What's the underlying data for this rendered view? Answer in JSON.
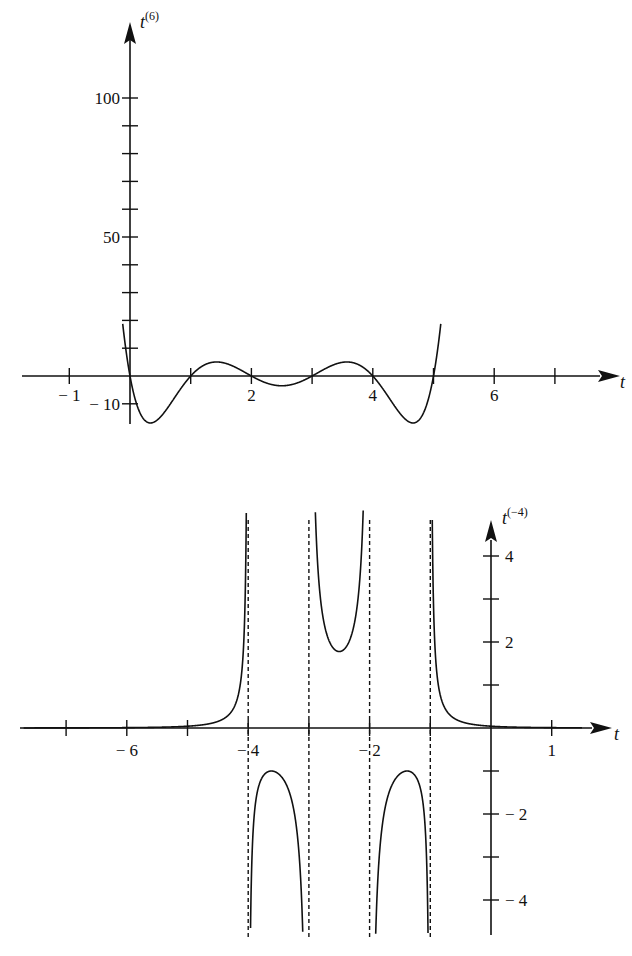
{
  "chart_data": [
    {
      "type": "line",
      "title": "",
      "function": "t^(6) = t(t-1)(t-2)(t-3)(t-4)(t-5)",
      "xlabel": "t",
      "ylabel": "t^(6)",
      "ylabel_base": "t",
      "ylabel_sup": "(6)",
      "xlim": [
        -1.7,
        7.3
      ],
      "ylim": [
        -12,
        106
      ],
      "x_ticks": [
        -1,
        0,
        1,
        2,
        3,
        4,
        5,
        6,
        7
      ],
      "x_tick_labels": [
        {
          "value": -1,
          "label": "− 1"
        },
        {
          "value": 2,
          "label": "2"
        },
        {
          "value": 4,
          "label": "4"
        },
        {
          "value": 6,
          "label": "6"
        }
      ],
      "y_ticks": [
        -10,
        10,
        20,
        30,
        40,
        50,
        60,
        70,
        80,
        90,
        100
      ],
      "y_tick_labels": [
        {
          "value": 100,
          "label": "100"
        },
        {
          "value": 50,
          "label": "50"
        },
        {
          "value": -10,
          "label": "− 10"
        }
      ],
      "roots": [
        0,
        1,
        2,
        3,
        4,
        5
      ],
      "key_points": [
        {
          "t": 0.35,
          "y": -11.0
        },
        {
          "t": 1.45,
          "y": 4.0
        },
        {
          "t": 2.5,
          "y": -2.9
        },
        {
          "t": 3.55,
          "y": 4.0
        },
        {
          "t": 4.65,
          "y": -11.0
        }
      ],
      "grid": false
    },
    {
      "type": "line",
      "title": "",
      "function": "t^(-4) = 1/((t+1)(t+2)(t+3)(t+4))",
      "xlabel": "t",
      "ylabel": "t^(-4)",
      "ylabel_base": "t",
      "ylabel_sup": "(−4)",
      "xlim": [
        -7.8,
        1.8
      ],
      "ylim": [
        -5,
        5.2
      ],
      "x_ticks": [
        -7,
        -6,
        -5,
        -4,
        -3,
        -2,
        -1,
        0,
        1
      ],
      "x_tick_labels": [
        {
          "value": -6,
          "label": "− 6"
        },
        {
          "value": -4,
          "label": "− 4"
        },
        {
          "value": -2,
          "label": "− 2"
        },
        {
          "value": 1,
          "label": "1"
        }
      ],
      "y_ticks": [
        -4,
        -3,
        -2,
        -1,
        1,
        2,
        3,
        4
      ],
      "y_tick_labels": [
        {
          "value": 4,
          "label": "4"
        },
        {
          "value": 2,
          "label": "2"
        },
        {
          "value": -2,
          "label": "− 2"
        },
        {
          "value": -4,
          "label": "− 4"
        }
      ],
      "vertical_asymptotes": [
        -4,
        -3,
        -2,
        -1
      ],
      "key_points": [
        {
          "t": -3.5,
          "y": -1.07
        },
        {
          "t": -2.5,
          "y": 1.78
        },
        {
          "t": -1.5,
          "y": -1.07
        }
      ],
      "grid": false
    }
  ]
}
